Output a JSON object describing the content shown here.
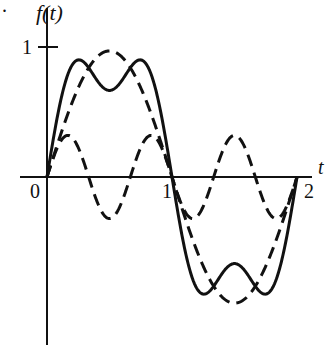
{
  "figure": {
    "y_axis_label": "f(t)",
    "x_axis_label": "t",
    "y_tick_label": "1",
    "x_tick_labels": [
      "0",
      "1",
      "2"
    ],
    "corner_mark": "."
  },
  "chart_data": {
    "type": "line",
    "title": "",
    "xlabel": "t",
    "ylabel": "f(t)",
    "xlim": [
      0,
      2
    ],
    "ylim": [
      -1,
      1
    ],
    "x_ticks": [
      0,
      1,
      2
    ],
    "y_ticks": [
      1
    ],
    "grid": false,
    "legend": null,
    "series": [
      {
        "name": "fundamental",
        "style": "dashed",
        "formula": "(4/pi)*0.76*sin(pi t)",
        "amplitude": 0.97,
        "x": [
          0,
          0.25,
          0.5,
          0.75,
          1,
          1.25,
          1.5,
          1.75,
          2
        ],
        "values": [
          0,
          0.69,
          0.97,
          0.69,
          0,
          -0.69,
          -0.97,
          -0.69,
          0
        ]
      },
      {
        "name": "third harmonic",
        "style": "dashed",
        "formula": "0.32*sin(3 pi t)",
        "amplitude": 0.32,
        "x": [
          0,
          0.1667,
          0.3333,
          0.5,
          0.6667,
          0.8333,
          1,
          1.1667,
          1.3333,
          1.5,
          1.6667,
          1.8333,
          2
        ],
        "values": [
          0,
          0.32,
          0,
          -0.32,
          0,
          0.32,
          0,
          0.32,
          0,
          -0.32,
          0,
          0.32,
          0
        ]
      },
      {
        "name": "sum",
        "style": "solid",
        "formula": "fundamental + third harmonic",
        "x": [
          0,
          0.1667,
          0.25,
          0.5,
          0.75,
          0.8333,
          1,
          1.1667,
          1.25,
          1.5,
          1.75,
          1.8333,
          2
        ],
        "values": [
          0,
          0.8,
          0.92,
          0.65,
          0.92,
          0.8,
          0,
          -0.8,
          -0.92,
          -0.65,
          -0.92,
          -0.8,
          0
        ]
      }
    ]
  }
}
